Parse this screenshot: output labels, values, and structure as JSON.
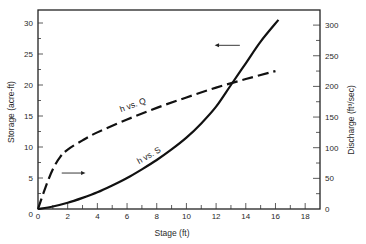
{
  "chart_data": {
    "type": "line",
    "title": "",
    "xlabel": "Stage (ft)",
    "ylabel_left": "Storage (acre-ft)",
    "ylabel_right": "Discharge (ft³/sec)",
    "xlim": [
      0,
      19
    ],
    "ylim_left": [
      0,
      32
    ],
    "ylim_right": [
      0,
      320
    ],
    "xticks": [
      0,
      2,
      4,
      6,
      8,
      10,
      12,
      14,
      16,
      18
    ],
    "yticks_left": [
      0,
      5,
      10,
      15,
      20,
      25,
      30
    ],
    "yticks_right": [
      0,
      50,
      100,
      150,
      200,
      250,
      300
    ],
    "grid": false,
    "series": [
      {
        "name": "h vs. S",
        "axis": "left",
        "style": "solid",
        "x": [
          0,
          1,
          2,
          3,
          4,
          5,
          6,
          7,
          8,
          9,
          10,
          11,
          12,
          13,
          14,
          15,
          16.2
        ],
        "y": [
          0,
          0.4,
          1.0,
          1.8,
          2.7,
          3.8,
          5.0,
          6.4,
          7.9,
          9.6,
          11.5,
          13.8,
          16.5,
          20.0,
          23.5,
          27.0,
          30.5
        ]
      },
      {
        "name": "h vs. Q",
        "axis": "right",
        "style": "dashed",
        "x": [
          0,
          0.5,
          1,
          1.5,
          2,
          3,
          4,
          6,
          8,
          10,
          12,
          14,
          16
        ],
        "y": [
          0,
          35,
          65,
          85,
          97,
          112,
          125,
          146,
          165,
          182,
          198,
          212,
          225
        ]
      }
    ],
    "annotations": [
      {
        "text": "h vs. Q",
        "x": 5.5,
        "y_right": 160
      },
      {
        "text": "h vs. S",
        "x": 7.2,
        "y_left": 8
      },
      {
        "text": "arrow pointing right (h vs. Q uses right axis)",
        "x": 1.8,
        "y_left": 6
      },
      {
        "text": "arrow pointing left (h vs. S uses left axis)",
        "x": 12.5,
        "y_left": 27.5
      }
    ]
  }
}
